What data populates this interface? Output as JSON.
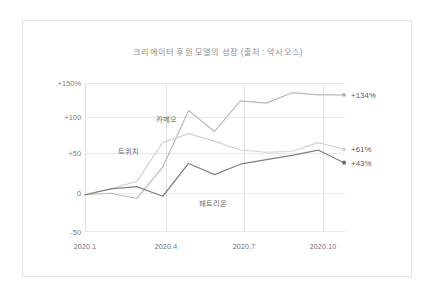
{
  "chart_data": {
    "type": "line",
    "title": "크리에이터 후원 모델의 성장 (출처 : 악시오스)",
    "xlabel": "",
    "ylabel": "",
    "grid": true,
    "legend_position": "inline-annotations",
    "x": [
      "2020.1",
      "2020.2",
      "2020.3",
      "2020.4",
      "2020.5",
      "2020.6",
      "2020.7",
      "2020.8",
      "2020.9",
      "2020.10",
      "2020.11"
    ],
    "xticks": [
      "2020.1",
      "2020.4",
      "2020.7",
      "2020.10"
    ],
    "xtick_index": [
      0,
      3,
      6,
      9
    ],
    "yticks": [
      "+150%",
      "+100",
      "+50",
      "0",
      "-50"
    ],
    "ytick_values": [
      150,
      100,
      50,
      0,
      -50
    ],
    "ylim": [
      -50,
      150
    ],
    "series": [
      {
        "name": "카메오",
        "color": "#b9b9b9",
        "end_label": "+134%",
        "end_value": 134,
        "values": [
          0,
          2,
          -5,
          37,
          113,
          85,
          126,
          123,
          137,
          134,
          134
        ]
      },
      {
        "name": "트위치",
        "color": "#d2d2d2",
        "end_label": "+61%",
        "end_value": 61,
        "values": [
          0,
          8,
          18,
          70,
          82,
          72,
          60,
          57,
          58,
          70,
          61
        ]
      },
      {
        "name": "패트리온",
        "color": "#808080",
        "end_label": "+43%",
        "end_value": 43,
        "values": [
          0,
          8,
          11,
          -2,
          42,
          27,
          41,
          47,
          53,
          60,
          43
        ]
      }
    ]
  },
  "labels": {
    "cameo": "카메오",
    "twitch": "트위치",
    "patreon": "패트리온",
    "end_cameo": "+134%",
    "end_twitch": "+61%",
    "end_patreon": "+43%",
    "y0": "+150%",
    "y1": "+100",
    "y2": "+50",
    "y3": "0",
    "y4": "-50",
    "x0": "2020.1",
    "x1": "2020.4",
    "x2": "2020.7",
    "x3": "2020.10"
  },
  "colors": {
    "grid": "#e8e8e8",
    "axis": "#d8d8d8",
    "card_border": "#e3e3e3",
    "title_text": "#8e8e8e",
    "tick_text": "#7d7d7d"
  }
}
